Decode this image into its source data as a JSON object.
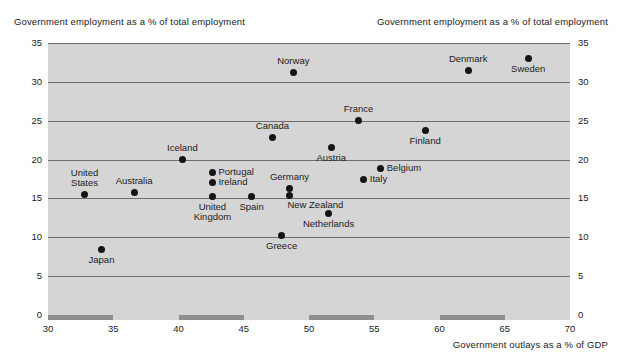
{
  "chart_data": {
    "type": "scatter",
    "title": "",
    "xlabel": "Government outlays as a % of GDP",
    "ylabel": "Government employment as a % of total employment",
    "ylabel_right": "Government employment as a % of total employment",
    "xlim": [
      30,
      70
    ],
    "ylim": [
      0,
      35
    ],
    "xticks": [
      30,
      35,
      40,
      45,
      50,
      55,
      60,
      65,
      70
    ],
    "yticks": [
      0,
      5,
      10,
      15,
      20,
      25,
      30,
      35
    ],
    "grid": "horizontal",
    "legend": "none",
    "plot_background": "#d5d5d5",
    "marker_color": "#141414",
    "gridline_color": "#6e6e6e",
    "axis_band_color": "#8f8f8f",
    "points": [
      {
        "label": "Norway",
        "x": 48.8,
        "y": 31.2,
        "label_pos": "above-center"
      },
      {
        "label": "Denmark",
        "x": 62.2,
        "y": 31.5,
        "label_pos": "above-center"
      },
      {
        "label": "Sweden",
        "x": 66.8,
        "y": 33.0,
        "label_pos": "below-center"
      },
      {
        "label": "France",
        "x": 53.8,
        "y": 25.0,
        "label_pos": "above-center"
      },
      {
        "label": "Canada",
        "x": 47.2,
        "y": 22.8,
        "label_pos": "above-center"
      },
      {
        "label": "Finland",
        "x": 58.9,
        "y": 23.7,
        "label_pos": "below-center"
      },
      {
        "label": "Austria",
        "x": 51.7,
        "y": 21.5,
        "label_pos": "below-center"
      },
      {
        "label": "Iceland",
        "x": 40.3,
        "y": 20.0,
        "label_pos": "above-center"
      },
      {
        "label": "Belgium",
        "x": 55.5,
        "y": 18.8,
        "label_pos": "right"
      },
      {
        "label": "Italy",
        "x": 54.2,
        "y": 17.5,
        "label_pos": "right"
      },
      {
        "label": "Portugal",
        "x": 42.6,
        "y": 18.4,
        "label_pos": "right"
      },
      {
        "label": "Ireland",
        "x": 42.6,
        "y": 17.0,
        "label_pos": "right"
      },
      {
        "label": "Germany",
        "x": 48.5,
        "y": 16.3,
        "label_pos": "above-center"
      },
      {
        "label": "United\nStates",
        "x": 32.8,
        "y": 15.5,
        "label_pos": "above-center"
      },
      {
        "label": "Australia",
        "x": 36.6,
        "y": 15.7,
        "label_pos": "above-center"
      },
      {
        "label": "United\nKingdom",
        "x": 42.6,
        "y": 15.2,
        "label_pos": "below-center"
      },
      {
        "label": "Spain",
        "x": 45.6,
        "y": 15.2,
        "label_pos": "below-center"
      },
      {
        "label": "New Zealand",
        "x": 48.5,
        "y": 15.4,
        "label_pos": "below-right"
      },
      {
        "label": "Netherlands",
        "x": 51.5,
        "y": 13.0,
        "label_pos": "below-center"
      },
      {
        "label": "Greece",
        "x": 47.9,
        "y": 10.2,
        "label_pos": "below-center"
      },
      {
        "label": "Japan",
        "x": 34.1,
        "y": 8.4,
        "label_pos": "below-center"
      }
    ],
    "axis_bands": [
      {
        "from": 30,
        "to": 35,
        "on": true
      },
      {
        "from": 35,
        "to": 40,
        "on": false
      },
      {
        "from": 40,
        "to": 45,
        "on": true
      },
      {
        "from": 45,
        "to": 50,
        "on": false
      },
      {
        "from": 50,
        "to": 55,
        "on": true
      },
      {
        "from": 55,
        "to": 60,
        "on": false
      },
      {
        "from": 60,
        "to": 65,
        "on": true
      },
      {
        "from": 65,
        "to": 70,
        "on": false
      }
    ]
  }
}
